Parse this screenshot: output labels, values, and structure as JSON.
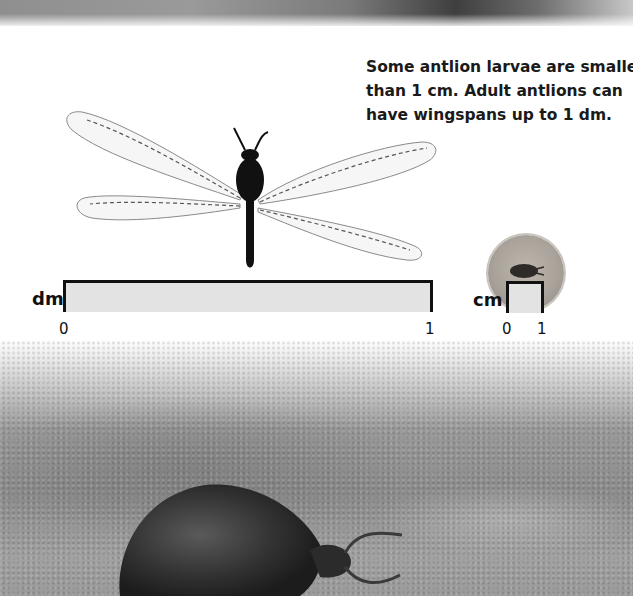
{
  "page": {
    "caption_lines": [
      "Some antlion larvae are smaller",
      "than 1 cm. Adult antlions can",
      "have wingspans up to 1 dm."
    ],
    "images": {
      "top_strip": "sand-photo-strip",
      "adult": "adult-antlion-photo",
      "larva_small": "antlion-larva-circle-photo",
      "larva_large": "antlion-larva-in-sand-photo"
    },
    "dm_scale": {
      "unit": "dm",
      "start_label": "0",
      "end_label": "1"
    },
    "cm_scale": {
      "unit": "cm",
      "start_label": "0",
      "end_label": "1"
    },
    "colors": {
      "text": "#1a1a1a",
      "ruler_fill": "#e3e3e3",
      "ruler_border": "#111111"
    }
  }
}
